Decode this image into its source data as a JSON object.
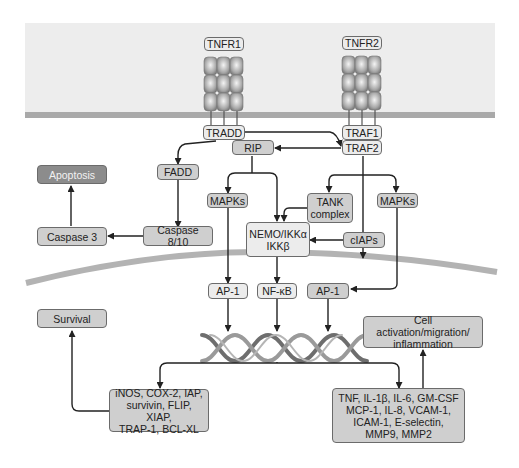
{
  "diagram": {
    "receptors": [
      {
        "label": "TNFR1"
      },
      {
        "label": "TNFR2"
      }
    ],
    "nodes": {
      "tnfr1": "TNFR1",
      "tnfr2": "TNFR2",
      "tradd": "TRADD",
      "traf1": "TRAF1",
      "traf2": "TRAF2",
      "rip": "RIP",
      "fadd": "FADD",
      "apoptosis": "Apoptosis",
      "caspase3": "Caspase 3",
      "caspase810": "Caspase 8/10",
      "mapks_left": "MAPKs",
      "tank": "TANK\ncomplex",
      "mapks_right": "MAPKs",
      "nemo": "NEMO/IKKα\nIKKβ",
      "ciaps": "cIAPs",
      "ap1_left": "AP-1",
      "nfkb": "NF-κB",
      "ap1_right": "AP-1",
      "survival": "Survival",
      "cell_activation": "Cell activation/migration/\ninflammation",
      "survival_genes": "iNOS, COX-2, IAP,\nsurvivin, FLIP, XIAP,\nTRAP-1, BCL-XL",
      "inflammation_genes": "TNF, IL-1β, IL-6, GM-CSF\nMCP-1, IL-8, VCAM-1,\nICAM-1, E-selectin,\nMMP9, MMP2"
    },
    "edges": [
      {
        "from": "TRADD",
        "to": "TRAF2"
      },
      {
        "from": "TRADD",
        "to": "FADD"
      },
      {
        "from": "TRAF2",
        "to": "RIP"
      },
      {
        "from": "FADD",
        "to": "Caspase 8/10"
      },
      {
        "from": "Caspase 8/10",
        "to": "Caspase 3"
      },
      {
        "from": "Caspase 3",
        "to": "Apoptosis"
      },
      {
        "from": "RIP",
        "to": "MAPKs"
      },
      {
        "from": "RIP",
        "to": "NEMO/IKKα IKKβ"
      },
      {
        "from": "TRAF2",
        "to": "TANK complex"
      },
      {
        "from": "TRAF2",
        "to": "MAPKs"
      },
      {
        "from": "TRAF2",
        "to": "cIAPs"
      },
      {
        "from": "TANK complex",
        "to": "NEMO/IKKα IKKβ"
      },
      {
        "from": "cIAPs",
        "to": "NEMO/IKKα IKKβ"
      },
      {
        "from": "MAPKs",
        "to": "AP-1"
      },
      {
        "from": "NEMO/IKKα IKKβ",
        "to": "NF-κB"
      },
      {
        "from": "MAPKs",
        "to": "AP-1"
      },
      {
        "from": "AP-1",
        "to": "DNA"
      },
      {
        "from": "NF-κB",
        "to": "DNA"
      },
      {
        "from": "AP-1",
        "to": "DNA"
      },
      {
        "from": "DNA",
        "to": "survival genes"
      },
      {
        "from": "DNA",
        "to": "inflammation genes"
      },
      {
        "from": "survival genes",
        "to": "Survival"
      },
      {
        "from": "inflammation genes",
        "to": "Cell activation/migration/inflammation"
      }
    ],
    "colors": {
      "background_band": "#ededed",
      "membrane": "#a9a9a9",
      "node_fill": "#e6e6e6",
      "node_dark": "#8c8c8c",
      "node_mid": "#cfcfcf",
      "stroke": "#222222"
    }
  }
}
